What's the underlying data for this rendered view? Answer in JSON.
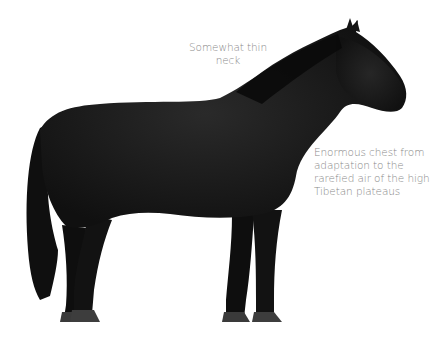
{
  "figure": {
    "colors": {
      "background": "#ffffff",
      "coat": "#121212",
      "coat_highlight": "#2a2a2a",
      "hoof": "#3a3a3a",
      "annotation_text": "#8a8a8a"
    },
    "annotations": [
      {
        "id": "neck",
        "lines": [
          "Somewhat thin",
          "neck"
        ]
      },
      {
        "id": "chest",
        "lines": [
          "Enormous chest from",
          "adaptation to the",
          "rarefied air of the high",
          "Tibetan plateaus"
        ]
      }
    ]
  }
}
